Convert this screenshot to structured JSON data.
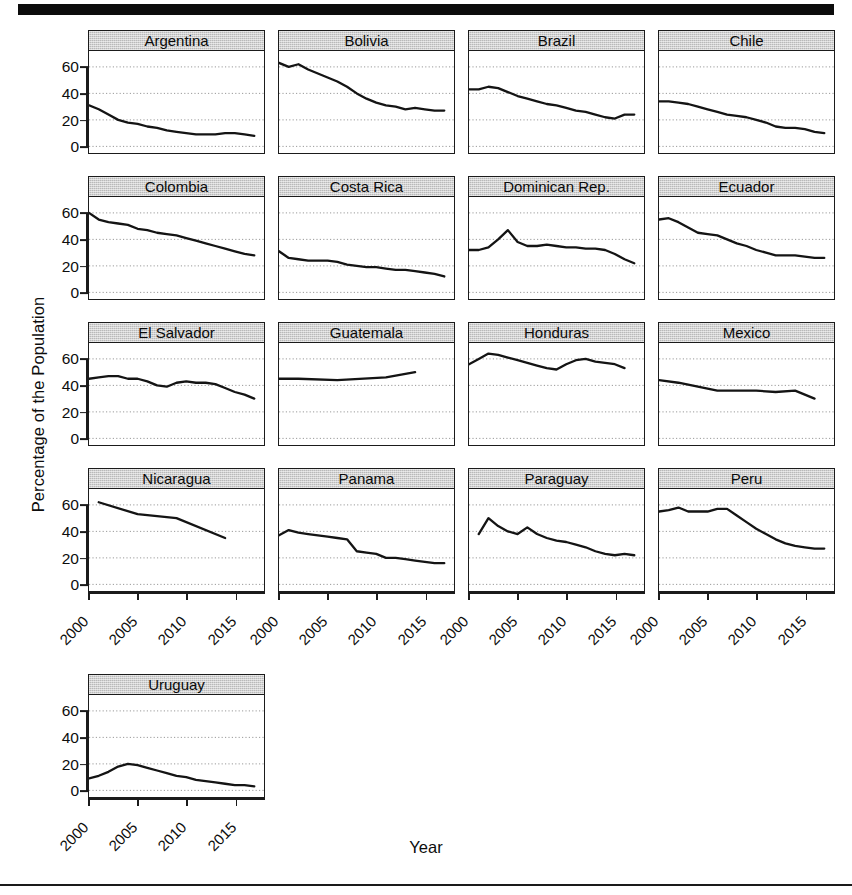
{
  "chart_data": {
    "type": "line",
    "title": "",
    "xlabel": "Year",
    "ylabel": "Percentage of the Population",
    "xlim": [
      2000,
      2018
    ],
    "ylim": [
      -5,
      72
    ],
    "yticks": [
      0,
      20,
      40,
      60
    ],
    "xticks": [
      2000,
      2005,
      2010,
      2015
    ],
    "grid": true,
    "legend": "none",
    "layout": "small-multiples 4 columns x 5 rows",
    "panels": [
      {
        "name": "Argentina",
        "x": [
          2000,
          2001,
          2002,
          2003,
          2004,
          2005,
          2006,
          2007,
          2008,
          2009,
          2010,
          2011,
          2012,
          2013,
          2014,
          2015,
          2016,
          2017
        ],
        "values": [
          31,
          28,
          24,
          20,
          18,
          17,
          15,
          14,
          12,
          11,
          10,
          9,
          9,
          9,
          10,
          10,
          9,
          8
        ]
      },
      {
        "name": "Bolivia",
        "x": [
          2000,
          2001,
          2002,
          2003,
          2004,
          2005,
          2006,
          2007,
          2008,
          2009,
          2010,
          2011,
          2012,
          2013,
          2014,
          2015,
          2016,
          2017
        ],
        "values": [
          63,
          60,
          62,
          58,
          55,
          52,
          49,
          45,
          40,
          36,
          33,
          31,
          30,
          28,
          29,
          28,
          27,
          27
        ]
      },
      {
        "name": "Brazil",
        "x": [
          2000,
          2001,
          2002,
          2003,
          2004,
          2005,
          2006,
          2007,
          2008,
          2009,
          2010,
          2011,
          2012,
          2013,
          2014,
          2015,
          2016,
          2017
        ],
        "values": [
          43,
          43,
          45,
          44,
          41,
          38,
          36,
          34,
          32,
          31,
          29,
          27,
          26,
          24,
          22,
          21,
          24,
          24
        ]
      },
      {
        "name": "Chile",
        "x": [
          2000,
          2001,
          2002,
          2003,
          2004,
          2005,
          2006,
          2007,
          2008,
          2009,
          2010,
          2011,
          2012,
          2013,
          2014,
          2015,
          2016,
          2017
        ],
        "values": [
          34,
          34,
          33,
          32,
          30,
          28,
          26,
          24,
          23,
          22,
          20,
          18,
          15,
          14,
          14,
          13,
          11,
          10
        ]
      },
      {
        "name": "Colombia",
        "x": [
          2000,
          2001,
          2002,
          2003,
          2004,
          2005,
          2006,
          2007,
          2008,
          2009,
          2010,
          2011,
          2012,
          2013,
          2014,
          2015,
          2016,
          2017
        ],
        "values": [
          60,
          55,
          53,
          52,
          51,
          48,
          47,
          45,
          44,
          43,
          41,
          39,
          37,
          35,
          33,
          31,
          29,
          28
        ]
      },
      {
        "name": "Costa Rica",
        "x": [
          2000,
          2001,
          2002,
          2003,
          2004,
          2005,
          2006,
          2007,
          2008,
          2009,
          2010,
          2011,
          2012,
          2013,
          2014,
          2015,
          2016,
          2017
        ],
        "values": [
          31,
          26,
          25,
          24,
          24,
          24,
          23,
          21,
          20,
          19,
          19,
          18,
          17,
          17,
          16,
          15,
          14,
          12
        ]
      },
      {
        "name": "Dominican Rep.",
        "x": [
          2000,
          2001,
          2002,
          2003,
          2004,
          2005,
          2006,
          2007,
          2008,
          2009,
          2010,
          2011,
          2012,
          2013,
          2014,
          2015,
          2016,
          2017
        ],
        "values": [
          32,
          32,
          34,
          40,
          47,
          38,
          35,
          35,
          36,
          35,
          34,
          34,
          33,
          33,
          32,
          29,
          25,
          22
        ]
      },
      {
        "name": "Ecuador",
        "x": [
          2000,
          2001,
          2002,
          2003,
          2004,
          2005,
          2006,
          2007,
          2008,
          2009,
          2010,
          2011,
          2012,
          2013,
          2014,
          2015,
          2016,
          2017
        ],
        "values": [
          55,
          56,
          53,
          49,
          45,
          44,
          43,
          40,
          37,
          35,
          32,
          30,
          28,
          28,
          28,
          27,
          26,
          26
        ]
      },
      {
        "name": "El Salvador",
        "x": [
          2000,
          2001,
          2002,
          2003,
          2004,
          2005,
          2006,
          2007,
          2008,
          2009,
          2010,
          2011,
          2012,
          2013,
          2014,
          2015,
          2016,
          2017
        ],
        "values": [
          45,
          46,
          47,
          47,
          45,
          45,
          43,
          40,
          39,
          42,
          43,
          42,
          42,
          41,
          38,
          35,
          33,
          30
        ]
      },
      {
        "name": "Guatemala",
        "x": [
          2000,
          2002,
          2006,
          2011,
          2014
        ],
        "values": [
          45,
          45,
          44,
          46,
          50
        ]
      },
      {
        "name": "Honduras",
        "x": [
          2000,
          2001,
          2002,
          2003,
          2004,
          2005,
          2006,
          2007,
          2008,
          2009,
          2010,
          2011,
          2012,
          2013,
          2014,
          2015,
          2016
        ],
        "values": [
          56,
          60,
          64,
          63,
          61,
          59,
          57,
          55,
          53,
          52,
          56,
          59,
          60,
          58,
          57,
          56,
          53
        ]
      },
      {
        "name": "Mexico",
        "x": [
          2000,
          2002,
          2004,
          2006,
          2008,
          2010,
          2012,
          2014,
          2016
        ],
        "values": [
          44,
          42,
          39,
          36,
          36,
          36,
          35,
          36,
          30
        ]
      },
      {
        "name": "Nicaragua",
        "x": [
          2001,
          2005,
          2009,
          2014
        ],
        "values": [
          62,
          53,
          50,
          35
        ]
      },
      {
        "name": "Panama",
        "x": [
          2000,
          2001,
          2002,
          2003,
          2004,
          2005,
          2006,
          2007,
          2008,
          2009,
          2010,
          2011,
          2012,
          2013,
          2014,
          2015,
          2016,
          2017
        ],
        "values": [
          37,
          41,
          39,
          38,
          37,
          36,
          35,
          34,
          25,
          24,
          23,
          20,
          20,
          19,
          18,
          17,
          16,
          16
        ]
      },
      {
        "name": "Paraguay",
        "x": [
          2001,
          2002,
          2003,
          2004,
          2005,
          2006,
          2007,
          2008,
          2009,
          2010,
          2011,
          2012,
          2013,
          2014,
          2015,
          2016,
          2017
        ],
        "values": [
          38,
          50,
          44,
          40,
          38,
          43,
          38,
          35,
          33,
          32,
          30,
          28,
          25,
          23,
          22,
          23,
          22
        ]
      },
      {
        "name": "Peru",
        "x": [
          2000,
          2001,
          2002,
          2003,
          2004,
          2005,
          2006,
          2007,
          2008,
          2009,
          2010,
          2011,
          2012,
          2013,
          2014,
          2015,
          2016,
          2017
        ],
        "values": [
          55,
          56,
          58,
          55,
          55,
          55,
          57,
          57,
          52,
          47,
          42,
          38,
          34,
          31,
          29,
          28,
          27,
          27
        ]
      },
      {
        "name": "Uruguay",
        "x": [
          2000,
          2001,
          2002,
          2003,
          2004,
          2005,
          2006,
          2007,
          2008,
          2009,
          2010,
          2011,
          2012,
          2013,
          2014,
          2015,
          2016,
          2017
        ],
        "values": [
          9,
          11,
          14,
          18,
          20,
          19,
          17,
          15,
          13,
          11,
          10,
          8,
          7,
          6,
          5,
          4,
          4,
          3
        ]
      }
    ]
  }
}
